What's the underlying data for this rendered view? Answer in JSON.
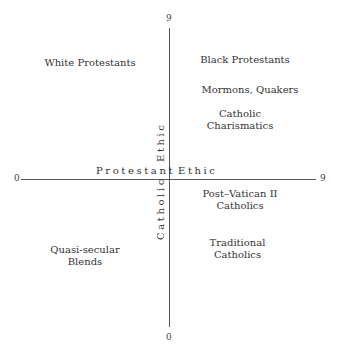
{
  "diagram": {
    "axes": {
      "horizontal": {
        "min_label": "0",
        "max_label": "9",
        "left_label": "Protestant",
        "right_label": "Ethic"
      },
      "vertical": {
        "max_label": "9",
        "min_label": "0",
        "upper_label": "Ethic",
        "lower_label": "Catholic"
      }
    },
    "labels": [
      {
        "id": "white-protestants",
        "text": "White Protestants"
      },
      {
        "id": "black-protestants",
        "text": "Black Protestants"
      },
      {
        "id": "mormons-quakers",
        "text": "Mormons, Quakers"
      },
      {
        "id": "catholic-charismatics",
        "text": "Catholic\nCharismatics"
      },
      {
        "id": "post-vatican",
        "text": "Post–Vatican II\nCatholics"
      },
      {
        "id": "traditional-catholics",
        "text": "Traditional\nCatholics"
      },
      {
        "id": "quasi-secular",
        "text": "Quasi-secular\nBlends"
      }
    ]
  }
}
